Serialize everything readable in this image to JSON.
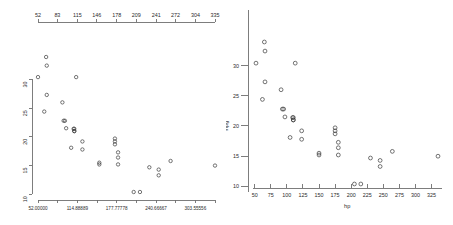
{
  "figure": {
    "title": "",
    "background": "#ffffff",
    "point_color": "#3a3a3a",
    "axis_color": "#6f6f6f"
  },
  "chart_data": [
    {
      "id": "left",
      "type": "scatter",
      "title": "",
      "xlabel": "",
      "ylabel": "",
      "xlim": [
        52,
        335
      ],
      "ylim": [
        10.4,
        33.9
      ],
      "grid": false,
      "legend": null,
      "axes": {
        "top": {
          "position": "top",
          "ticks": [
            52,
            83,
            115,
            146,
            178,
            209,
            241,
            272,
            304,
            335
          ],
          "labels": [
            "52",
            "83",
            "115",
            "146",
            "178",
            "209",
            "241",
            "272",
            "304",
            "335"
          ]
        },
        "bottom": {
          "position": "bottom",
          "ticks": [
            52,
            83.44444,
            114.88889,
            146.33333,
            177.77778,
            209.22222,
            240.66667,
            272.11111,
            303.55556,
            335
          ],
          "labels": [
            "52.00000",
            "",
            "114.88889",
            "",
            "177.77778",
            "",
            "240.66667",
            "",
            "303.55556",
            ""
          ]
        },
        "left": {
          "position": "left",
          "ticks": [
            10,
            15,
            20,
            25,
            30
          ],
          "labels": [
            "10",
            "15",
            "20",
            "25",
            "30"
          ]
        }
      },
      "series": [
        {
          "name": "mtcars",
          "x": [
            110,
            110,
            93,
            110,
            175,
            105,
            245,
            62,
            95,
            123,
            123,
            180,
            180,
            180,
            205,
            215,
            230,
            66,
            52,
            65,
            97,
            150,
            150,
            245,
            175,
            66,
            91,
            113,
            264,
            175,
            335,
            109
          ],
          "y": [
            21.0,
            21.0,
            22.8,
            21.4,
            18.7,
            18.1,
            14.3,
            24.4,
            22.8,
            19.2,
            17.8,
            16.4,
            17.3,
            15.2,
            10.4,
            10.4,
            14.7,
            32.4,
            30.4,
            33.9,
            21.5,
            15.5,
            15.2,
            13.3,
            19.2,
            27.3,
            26.0,
            30.4,
            15.8,
            19.7,
            15.0,
            21.4
          ]
        }
      ]
    },
    {
      "id": "right",
      "type": "scatter",
      "title": "",
      "xlabel": "hp",
      "ylabel": "mpg",
      "xlim": [
        52,
        335
      ],
      "ylim": [
        10.4,
        33.9
      ],
      "grid": false,
      "legend": null,
      "axes": {
        "bottom": {
          "position": "bottom",
          "ticks": [
            50,
            75,
            100,
            125,
            150,
            175,
            200,
            225,
            250,
            275,
            300,
            325
          ],
          "labels": [
            "50",
            "75",
            "100",
            "125",
            "150",
            "175",
            "200",
            "225",
            "250",
            "275",
            "300",
            "325"
          ]
        },
        "left": {
          "position": "left",
          "ticks": [
            10,
            15,
            20,
            25,
            30
          ],
          "labels": [
            "10",
            "15",
            "20",
            "25",
            "30"
          ]
        }
      },
      "series": [
        {
          "name": "mtcars",
          "x": [
            110,
            110,
            93,
            110,
            175,
            105,
            245,
            62,
            95,
            123,
            123,
            180,
            180,
            180,
            205,
            215,
            230,
            66,
            52,
            65,
            97,
            150,
            150,
            245,
            175,
            66,
            91,
            113,
            264,
            175,
            335,
            109
          ],
          "y": [
            21.0,
            21.0,
            22.8,
            21.4,
            18.7,
            18.1,
            14.3,
            24.4,
            22.8,
            19.2,
            17.8,
            16.4,
            17.3,
            15.2,
            10.4,
            10.4,
            14.7,
            32.4,
            30.4,
            33.9,
            21.5,
            15.5,
            15.2,
            13.3,
            19.2,
            27.3,
            26.0,
            30.4,
            15.8,
            19.7,
            15.0,
            21.4
          ]
        }
      ]
    }
  ]
}
